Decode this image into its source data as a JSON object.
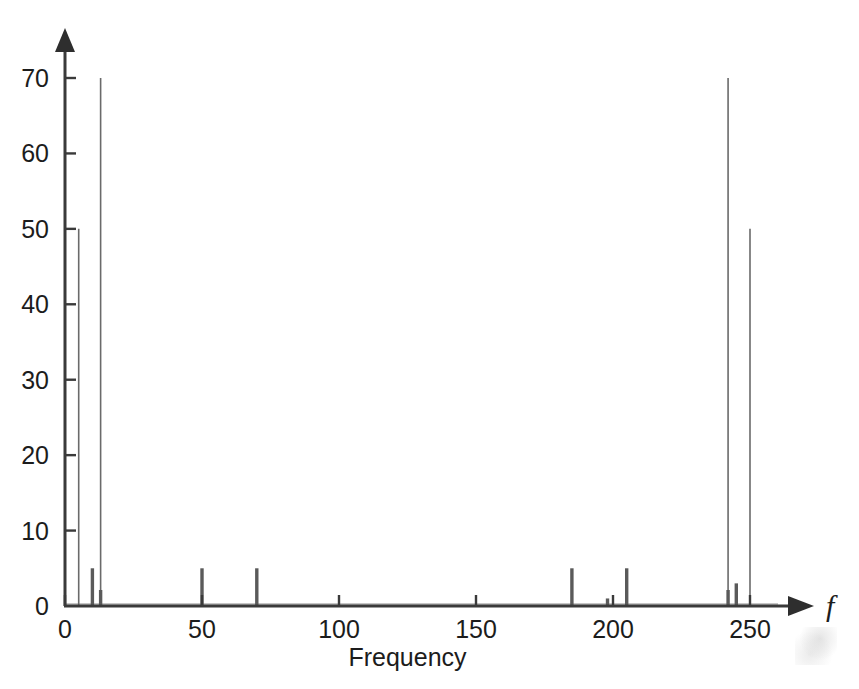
{
  "figure": {
    "background_color": "#ffffff",
    "ink_color": "#3a3a3a",
    "spike_color": "#6a6a6a"
  },
  "chart_data": {
    "type": "bar",
    "title": "",
    "subtitle": "",
    "xlabel": "Frequency",
    "ylabel": "",
    "x_axis_symbol": "f",
    "xlim": [
      0,
      262
    ],
    "ylim": [
      0,
      72
    ],
    "grid": false,
    "legend": null,
    "x_ticks": [
      0,
      50,
      100,
      150,
      200,
      250
    ],
    "x_tick_labels": [
      "0",
      "50",
      "100",
      "150",
      "200",
      "250"
    ],
    "y_ticks": [
      0,
      10,
      20,
      30,
      40,
      50,
      60,
      70
    ],
    "y_tick_labels": [
      "0",
      "10",
      "20",
      "30",
      "40",
      "50",
      "60",
      "70"
    ],
    "x": [
      5,
      10,
      13,
      50,
      70,
      185,
      198,
      205,
      242,
      245,
      250
    ],
    "values": [
      50,
      5,
      70,
      5,
      5,
      5,
      1,
      5,
      70,
      3,
      50
    ],
    "series": [
      {
        "name": "Magnitude spectrum",
        "points": [
          {
            "f": 5,
            "magnitude": 50
          },
          {
            "f": 10,
            "magnitude": 5
          },
          {
            "f": 13,
            "magnitude": 70
          },
          {
            "f": 50,
            "magnitude": 5
          },
          {
            "f": 70,
            "magnitude": 5
          },
          {
            "f": 185,
            "magnitude": 5
          },
          {
            "f": 198,
            "magnitude": 1
          },
          {
            "f": 205,
            "magnitude": 5
          },
          {
            "f": 242,
            "magnitude": 70
          },
          {
            "f": 245,
            "magnitude": 3
          },
          {
            "f": 250,
            "magnitude": 50
          }
        ]
      }
    ],
    "annotations": []
  },
  "axis_labels": {
    "x_title": "Frequency",
    "x_symbol": "f"
  }
}
